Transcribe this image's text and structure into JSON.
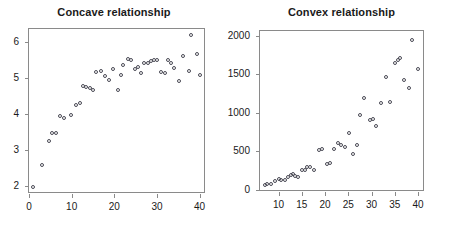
{
  "figure": {
    "background": "#ffffff",
    "point_color": "#4a4a55",
    "axis_color": "#8a8a8a",
    "text_color": "#1a1a1a"
  },
  "chart_data": [
    {
      "type": "scatter",
      "title": "Concave relationship",
      "xlabel": "",
      "ylabel": "",
      "xlim": [
        0,
        41.5
      ],
      "ylim": [
        1.78,
        6.35
      ],
      "xticks": [
        0,
        10,
        20,
        30,
        40
      ],
      "yticks": [
        2,
        3,
        4,
        5,
        6
      ],
      "xticklabels": [
        "0",
        "10",
        "20",
        "30",
        "40"
      ],
      "yticklabels": [
        "2",
        "3",
        "4",
        "5",
        "6"
      ],
      "grid": false,
      "legend": null,
      "marker": "open-circle",
      "x": [
        1,
        3,
        4.6,
        5.4,
        6.4,
        7.2,
        8.2,
        9.8,
        11,
        12,
        12.6,
        13.4,
        14.2,
        15,
        15.8,
        16.8,
        17.8,
        18.8,
        19.6,
        20.8,
        21.6,
        22,
        23.2,
        24,
        24.8,
        25.6,
        26.2,
        27,
        27.8,
        28.6,
        29.4,
        30,
        31,
        31.8,
        32.6,
        33.4,
        34,
        35.2,
        36,
        37.6,
        38,
        39.4,
        40
      ],
      "y": [
        1.97,
        2.58,
        3.25,
        3.46,
        3.47,
        3.95,
        3.88,
        3.98,
        4.25,
        4.3,
        4.77,
        4.75,
        4.71,
        4.67,
        5.15,
        5.2,
        5.05,
        4.93,
        5.25,
        4.65,
        5.08,
        5.35,
        5.52,
        5.48,
        5.25,
        5.3,
        5.12,
        5.4,
        5.42,
        5.45,
        5.5,
        5.48,
        5.17,
        5.12,
        5.5,
        5.42,
        5.28,
        4.91,
        5.6,
        5.18,
        6.18,
        5.67,
        5.07
      ]
    },
    {
      "type": "scatter",
      "title": "Convex relationship",
      "xlabel": "",
      "ylabel": "",
      "xlim": [
        6,
        41.5
      ],
      "ylim": [
        -30,
        2060
      ],
      "xticks": [
        10,
        15,
        20,
        25,
        30,
        35,
        40
      ],
      "yticks": [
        0,
        500,
        1000,
        1500,
        2000
      ],
      "xticklabels": [
        "10",
        "15",
        "20",
        "25",
        "30",
        "35",
        "40"
      ],
      "yticklabels": [
        "0",
        "500",
        "1000",
        "1500",
        "2000"
      ],
      "grid": false,
      "legend": null,
      "marker": "open-circle",
      "x": [
        7,
        7.6,
        8.4,
        9.2,
        10,
        10.6,
        11.4,
        12,
        12.6,
        13.2,
        13.6,
        14.2,
        15,
        15.6,
        16.2,
        16.8,
        17.6,
        18.6,
        19.4,
        20.4,
        21,
        22,
        22.8,
        23.4,
        24.2,
        25.2,
        26,
        26.8,
        27.6,
        28.4,
        29.6,
        30.4,
        31,
        32,
        33.2,
        34,
        35,
        35.6,
        36.2,
        37,
        38,
        38.8,
        40
      ],
      "y": [
        62,
        72,
        80,
        112,
        140,
        130,
        120,
        160,
        190,
        200,
        180,
        160,
        250,
        262,
        300,
        290,
        258,
        515,
        530,
        330,
        340,
        525,
        605,
        580,
        550,
        735,
        460,
        575,
        965,
        1190,
        905,
        915,
        825,
        1130,
        1460,
        1135,
        1650,
        1680,
        1705,
        1420,
        1325,
        1940,
        1570
      ]
    }
  ]
}
